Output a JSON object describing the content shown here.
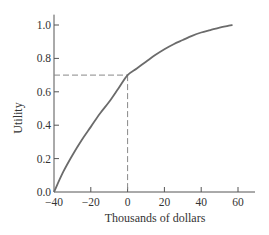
{
  "chart_data": {
    "type": "line",
    "title": "",
    "xlabel": "Thousands of dollars",
    "ylabel": "Utility",
    "xlim": [
      -40,
      70
    ],
    "ylim": [
      0,
      1.05
    ],
    "x_ticks": [
      -40,
      -20,
      0,
      20,
      40,
      60
    ],
    "x_tick_labels": [
      "−40",
      "−20",
      "0",
      "20",
      "40",
      "60"
    ],
    "y_ticks": [
      0.0,
      0.2,
      0.4,
      0.6,
      0.8,
      1.0
    ],
    "y_tick_labels": [
      "0.0",
      "0.2",
      "0.4",
      "0.6",
      "0.8",
      "1.0"
    ],
    "grid": false,
    "series": [
      {
        "name": "Utility curve",
        "color": "#6b6b6b",
        "x": [
          -40,
          -35,
          -30,
          -25,
          -20,
          -15,
          -10,
          -5,
          0,
          5,
          10,
          15,
          20,
          25,
          30,
          35,
          40,
          45,
          50,
          55,
          57
        ],
        "y": [
          0.0,
          0.12,
          0.22,
          0.31,
          0.39,
          0.47,
          0.54,
          0.62,
          0.7,
          0.74,
          0.78,
          0.82,
          0.855,
          0.885,
          0.91,
          0.935,
          0.955,
          0.97,
          0.985,
          0.996,
          1.0
        ]
      }
    ],
    "annotations": [
      {
        "type": "dashed-guide",
        "x": 0,
        "y": 0.7,
        "color": "#888888"
      }
    ]
  }
}
